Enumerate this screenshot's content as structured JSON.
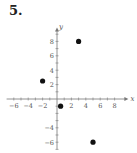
{
  "problem_number": "5.",
  "chart_data": {
    "type": "scatter",
    "title": "",
    "xlabel": "x",
    "ylabel": "y",
    "xlim": [
      -7,
      9.5
    ],
    "ylim": [
      -7,
      9.5
    ],
    "x_ticks": [
      -6,
      -4,
      -2,
      2,
      4,
      6,
      8
    ],
    "y_ticks": [
      -6,
      -4,
      2,
      4,
      6,
      8
    ],
    "x_tick_labels": [
      "−6",
      "−4",
      "−2",
      "2",
      "4",
      "6",
      "8"
    ],
    "y_tick_labels": [
      "−6",
      "−4",
      "2",
      "4",
      "6",
      "8"
    ],
    "grid": false,
    "points": [
      {
        "x": -2,
        "y": 2.5
      },
      {
        "x": 0.5,
        "y": -1
      },
      {
        "x": 3,
        "y": 8
      },
      {
        "x": 5,
        "y": -6
      }
    ],
    "point_color": "#111111"
  }
}
